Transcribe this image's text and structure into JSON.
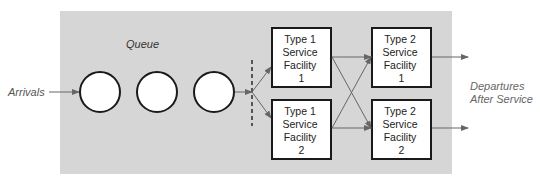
{
  "diagram": {
    "labels": {
      "arrivals": "Arrivals",
      "queue": "Queue",
      "departures_line1": "Departures",
      "departures_line2": "After Service"
    },
    "facilities": [
      {
        "id": "t1f1",
        "lines": [
          "Type 1",
          "Service",
          "Facility",
          "1"
        ]
      },
      {
        "id": "t1f2",
        "lines": [
          "Type 1",
          "Service",
          "Facility",
          "2"
        ]
      },
      {
        "id": "t2f1",
        "lines": [
          "Type 2",
          "Service",
          "Facility",
          "1"
        ]
      },
      {
        "id": "t2f2",
        "lines": [
          "Type 2",
          "Service",
          "Facility",
          "2"
        ]
      }
    ],
    "queue_items": 3,
    "colors": {
      "background_panel": "#d6d6d6",
      "box_fill": "#ffffff",
      "box_stroke": "#1a1a1a",
      "arrow": "#666666",
      "label_text": "#555555",
      "dashed_line": "#555555"
    }
  }
}
